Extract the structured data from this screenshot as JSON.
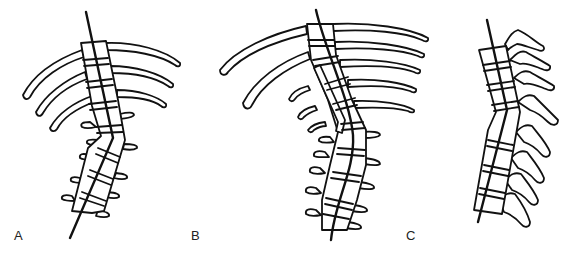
{
  "figure": {
    "background": "#ffffff",
    "line_color": "#111111",
    "panels": [
      {
        "id": "A",
        "label": "A",
        "content": "Thoracic spine with ribs, angular kyphotic bend at thoracolumbar junction, lumbar vertebrae with transverse processes"
      },
      {
        "id": "B",
        "label": "B",
        "content": "Long thoracic curve with multiple ribs, short rib stubs, S-shaped vertebral column"
      },
      {
        "id": "C",
        "label": "C",
        "content": "Lateral view of spine with spinous processes and angular bend"
      }
    ]
  }
}
